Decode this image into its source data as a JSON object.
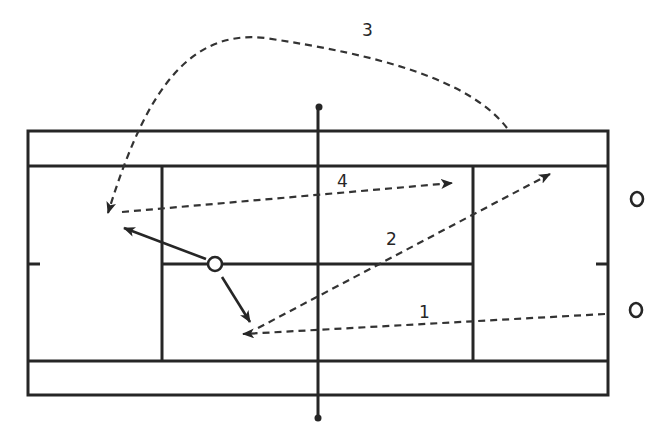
{
  "diagram": {
    "type": "tennis-court-shot-pattern",
    "colors": {
      "ink": "#262626",
      "background": "#ffffff"
    },
    "court": {
      "outer": {
        "x1": 28,
        "y1": 131,
        "x2": 608,
        "y2": 395
      },
      "doubles_lines_y": [
        166,
        361
      ],
      "service_lines_x": [
        162,
        473
      ],
      "center_service_line_y": 264,
      "net_x": 318,
      "net_posts_y": [
        107,
        418
      ],
      "center_marks_y": 264
    },
    "players": [
      {
        "id": "net-player",
        "x": 215,
        "y": 264
      },
      {
        "id": "opponent-1",
        "x": 637,
        "y": 199
      },
      {
        "id": "opponent-2",
        "x": 636,
        "y": 310
      }
    ],
    "shots": [
      {
        "label": "1",
        "label_pos": [
          424,
          312
        ]
      },
      {
        "label": "2",
        "label_pos": [
          392,
          244
        ]
      },
      {
        "label": "3",
        "label_pos": [
          368,
          35
        ]
      },
      {
        "label": "4",
        "label_pos": [
          343,
          186
        ]
      }
    ]
  }
}
